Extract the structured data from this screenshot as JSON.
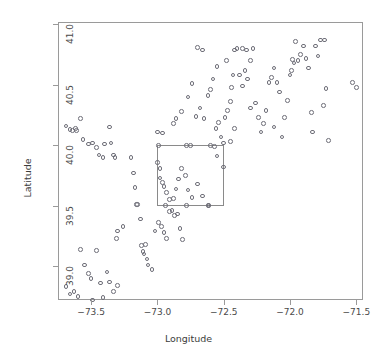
{
  "chart_data": {
    "type": "scatter",
    "title": "",
    "xlabel": "Longitude",
    "ylabel": "Latitude",
    "xlim": [
      -73.75,
      -71.45
    ],
    "ylim": [
      38.72,
      41.02
    ],
    "xticks": [
      -73.5,
      -73.0,
      -72.5,
      -72.0,
      -71.5
    ],
    "xticklabels": [
      "−73.5",
      "−73.0",
      "−72.5",
      "−72.0",
      "−71.5"
    ],
    "yticks": [
      39.0,
      39.5,
      40.0,
      40.5,
      41.0
    ],
    "yticklabels": [
      "39.0",
      "39.5",
      "40.0",
      "40.5",
      "41.0"
    ],
    "grid": false,
    "legend": null,
    "marker": "open-circle",
    "marker_color": "#6e6e78",
    "frame_color": "#9a9a9a",
    "annotations": [
      {
        "type": "rectangle",
        "name": "subregion-box",
        "x0": -73.0,
        "x1": -72.5,
        "y0": 39.5,
        "y1": 40.0,
        "color": "#8a8a8a"
      }
    ],
    "points": [
      [
        -73.69,
        40.16
      ],
      [
        -73.66,
        40.13
      ],
      [
        -73.64,
        40.12
      ],
      [
        -73.62,
        40.14
      ],
      [
        -73.61,
        40.12
      ],
      [
        -73.58,
        40.22
      ],
      [
        -73.56,
        40.05
      ],
      [
        -73.52,
        40.01
      ],
      [
        -73.49,
        40.02
      ],
      [
        -73.46,
        39.98
      ],
      [
        -73.44,
        39.92
      ],
      [
        -73.41,
        39.9
      ],
      [
        -73.4,
        40.01
      ],
      [
        -73.36,
        40.15
      ],
      [
        -73.35,
        40.02
      ],
      [
        -73.33,
        39.92
      ],
      [
        -73.32,
        39.9
      ],
      [
        -73.2,
        39.9
      ],
      [
        -73.18,
        39.77
      ],
      [
        -73.17,
        39.65
      ],
      [
        -73.16,
        39.51
      ],
      [
        -73.15,
        39.51
      ],
      [
        -73.13,
        39.39
      ],
      [
        -73.12,
        39.17
      ],
      [
        -73.11,
        39.12
      ],
      [
        -73.1,
        39.1
      ],
      [
        -73.09,
        39.18
      ],
      [
        -73.08,
        39.06
      ],
      [
        -73.07,
        39.01
      ],
      [
        -73.26,
        39.33
      ],
      [
        -73.3,
        39.29
      ],
      [
        -73.31,
        39.23
      ],
      [
        -73.58,
        39.14
      ],
      [
        -73.55,
        39.01
      ],
      [
        -73.52,
        38.94
      ],
      [
        -73.5,
        38.9
      ],
      [
        -73.46,
        39.13
      ],
      [
        -73.43,
        38.86
      ],
      [
        -73.38,
        38.95
      ],
      [
        -73.36,
        38.87
      ],
      [
        -73.33,
        38.79
      ],
      [
        -73.3,
        38.84
      ],
      [
        -73.69,
        38.83
      ],
      [
        -73.66,
        38.77
      ],
      [
        -73.63,
        38.79
      ],
      [
        -73.6,
        38.75
      ],
      [
        -73.49,
        38.72
      ],
      [
        -73.41,
        38.74
      ],
      [
        -73.04,
        38.97
      ],
      [
        -73.02,
        39.29
      ],
      [
        -72.99,
        39.36
      ],
      [
        -72.97,
        39.33
      ],
      [
        -72.95,
        39.28
      ],
      [
        -72.93,
        39.23
      ],
      [
        -72.91,
        39.45
      ],
      [
        -72.89,
        39.46
      ],
      [
        -72.87,
        39.42
      ],
      [
        -72.85,
        39.43
      ],
      [
        -72.83,
        39.31
      ],
      [
        -72.81,
        39.22
      ],
      [
        -73.0,
        39.86
      ],
      [
        -72.98,
        39.73
      ],
      [
        -72.96,
        39.69
      ],
      [
        -72.95,
        39.66
      ],
      [
        -72.93,
        39.61
      ],
      [
        -72.91,
        39.55
      ],
      [
        -72.88,
        39.56
      ],
      [
        -72.86,
        39.64
      ],
      [
        -72.84,
        39.72
      ],
      [
        -72.82,
        39.81
      ],
      [
        -72.79,
        39.75
      ],
      [
        -72.77,
        39.63
      ],
      [
        -72.74,
        39.57
      ],
      [
        -72.7,
        39.68
      ],
      [
        -72.66,
        39.58
      ],
      [
        -72.62,
        39.5
      ],
      [
        -72.98,
        39.81
      ],
      [
        -72.94,
        39.5
      ],
      [
        -72.78,
        39.5
      ],
      [
        -72.61,
        39.5
      ],
      [
        -72.99,
        40.0
      ],
      [
        -72.78,
        40.0
      ],
      [
        -72.75,
        40.0
      ],
      [
        -72.6,
        40.0
      ],
      [
        -72.57,
        39.99
      ],
      [
        -72.55,
        39.91
      ],
      [
        -72.5,
        39.82
      ],
      [
        -73.0,
        40.11
      ],
      [
        -72.96,
        40.1
      ],
      [
        -72.88,
        40.18
      ],
      [
        -72.86,
        40.22
      ],
      [
        -72.82,
        40.28
      ],
      [
        -72.77,
        40.4
      ],
      [
        -72.74,
        40.51
      ],
      [
        -72.71,
        40.24
      ],
      [
        -72.68,
        40.31
      ],
      [
        -72.65,
        40.22
      ],
      [
        -72.62,
        40.41
      ],
      [
        -72.6,
        40.46
      ],
      [
        -72.58,
        40.55
      ],
      [
        -72.56,
        40.14
      ],
      [
        -72.54,
        40.19
      ],
      [
        -72.52,
        40.07
      ],
      [
        -72.5,
        40.02
      ],
      [
        -72.49,
        40.23
      ],
      [
        -72.47,
        40.29
      ],
      [
        -72.45,
        40.36
      ],
      [
        -72.44,
        40.48
      ],
      [
        -72.43,
        40.58
      ],
      [
        -72.42,
        40.79
      ],
      [
        -72.4,
        40.8
      ],
      [
        -72.38,
        40.58
      ],
      [
        -72.36,
        40.49
      ],
      [
        -72.34,
        40.62
      ],
      [
        -72.32,
        40.55
      ],
      [
        -72.3,
        40.7
      ],
      [
        -72.28,
        40.8
      ],
      [
        -72.26,
        40.35
      ],
      [
        -72.24,
        40.23
      ],
      [
        -72.22,
        40.11
      ],
      [
        -72.2,
        40.18
      ],
      [
        -72.18,
        40.29
      ],
      [
        -72.16,
        40.52
      ],
      [
        -72.14,
        40.56
      ],
      [
        -72.12,
        40.64
      ],
      [
        -72.1,
        40.52
      ],
      [
        -72.08,
        40.44
      ],
      [
        -72.06,
        40.07
      ],
      [
        -72.04,
        40.23
      ],
      [
        -72.02,
        40.37
      ],
      [
        -72.0,
        40.58
      ],
      [
        -71.99,
        40.62
      ],
      [
        -71.98,
        40.71
      ],
      [
        -71.97,
        40.68
      ],
      [
        -71.96,
        40.86
      ],
      [
        -71.94,
        40.7
      ],
      [
        -71.92,
        40.75
      ],
      [
        -71.9,
        40.82
      ],
      [
        -71.88,
        40.72
      ],
      [
        -71.86,
        40.64
      ],
      [
        -71.84,
        40.27
      ],
      [
        -71.83,
        40.11
      ],
      [
        -71.81,
        40.82
      ],
      [
        -71.79,
        40.74
      ],
      [
        -71.77,
        40.87
      ],
      [
        -71.75,
        40.33
      ],
      [
        -71.74,
        40.87
      ],
      [
        -71.73,
        40.47
      ],
      [
        -71.71,
        40.04
      ],
      [
        -72.45,
        40.03
      ],
      [
        -72.36,
        40.8
      ],
      [
        -72.48,
        40.7
      ],
      [
        -72.42,
        40.14
      ],
      [
        -72.12,
        40.15
      ],
      [
        -72.7,
        40.81
      ],
      [
        -72.3,
        40.31
      ],
      [
        -72.55,
        40.65
      ],
      [
        -72.66,
        40.79
      ],
      [
        -71.53,
        40.52
      ],
      [
        -71.5,
        40.48
      ],
      [
        -72.33,
        40.79
      ]
    ]
  }
}
